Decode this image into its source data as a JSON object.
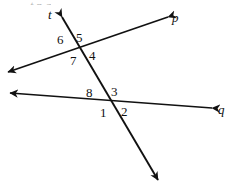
{
  "figure": {
    "type": "geometry-diagram",
    "canvas": {
      "width": 236,
      "height": 188,
      "background": "#ffffff"
    },
    "stroke_color": "#111111",
    "text_color": "#111111",
    "lines": [
      {
        "id": "line-t",
        "label": "t",
        "label_x": 48,
        "label_y": 8,
        "x1": 62,
        "y1": 17,
        "x2": 158,
        "y2": 180,
        "arrow_start": true,
        "arrow_end": true
      },
      {
        "id": "line-p",
        "label": "p",
        "label_x": 172,
        "label_y": 11,
        "x1": 168,
        "y1": 17,
        "x2": 8,
        "y2": 72,
        "arrow_start": true,
        "arrow_end": true
      },
      {
        "id": "line-q",
        "label": "q",
        "label_x": 218,
        "label_y": 103,
        "x1": 212,
        "y1": 108,
        "x2": 10,
        "y2": 93,
        "arrow_start": true,
        "arrow_end": true
      }
    ],
    "intersections": [
      {
        "id": "upper",
        "x": 78,
        "y": 48,
        "lines": [
          "line-t",
          "line-p"
        ]
      },
      {
        "id": "lower",
        "x": 110,
        "y": 100,
        "lines": [
          "line-t",
          "line-q"
        ]
      }
    ],
    "angle_labels": [
      {
        "id": "angle-6",
        "text": "6",
        "x": 57,
        "y": 33
      },
      {
        "id": "angle-5",
        "text": "5",
        "x": 76,
        "y": 31
      },
      {
        "id": "angle-7",
        "text": "7",
        "x": 70,
        "y": 54
      },
      {
        "id": "angle-4",
        "text": "4",
        "x": 89,
        "y": 49
      },
      {
        "id": "angle-8",
        "text": "8",
        "x": 86,
        "y": 86
      },
      {
        "id": "angle-3",
        "text": "3",
        "x": 111,
        "y": 85
      },
      {
        "id": "angle-1",
        "text": "1",
        "x": 100,
        "y": 106
      },
      {
        "id": "angle-2",
        "text": "2",
        "x": 121,
        "y": 105
      }
    ],
    "cropped_top_text": "t       p                    q"
  }
}
